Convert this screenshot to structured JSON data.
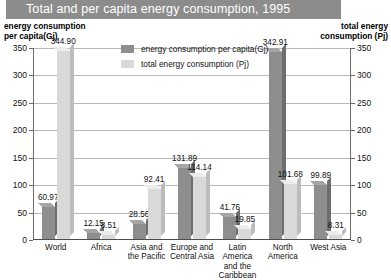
{
  "title": "Total and per capita energy consumption, 1995",
  "axis_captions": {
    "left": "energy consumption\nper capita(Gj)",
    "left_line1": "energy consumption",
    "left_line2": "per capita(Gj)",
    "right_line1": "total energy",
    "right_line2": "consumption (Pj)"
  },
  "colors": {
    "banner": "#8c8c8c",
    "series_per_capita": "#8e8e8e",
    "series_total": "#d9d9d9",
    "gridline": "#b9b9b9",
    "axis": "#6b6b6b"
  },
  "chart_data": {
    "type": "bar",
    "title": "Total and per capita energy consumption, 1995",
    "xlabel": "",
    "ylabel": "energy consumption per capita(Gj)",
    "y2label": "total energy consumption (Pj)",
    "ylim": [
      0,
      350
    ],
    "y2lim": [
      0,
      350
    ],
    "yticks": [
      0,
      50,
      100,
      150,
      200,
      250,
      300,
      350
    ],
    "y2ticks": [
      0,
      50,
      100,
      150,
      200,
      250,
      300,
      350
    ],
    "grid": true,
    "legend_position": "top-center",
    "categories": [
      "World",
      "Africa",
      "Asia and\nthe Pacific",
      "Europe and\nCentral Asia",
      "Latin America\nand the\nCaribbean",
      "North\nAmerica",
      "West Asia"
    ],
    "category_lines": [
      [
        "World"
      ],
      [
        "Africa"
      ],
      [
        "Asia and",
        "the Pacific"
      ],
      [
        "Europe and",
        "Central Asia"
      ],
      [
        "Latin America",
        "and the",
        "Caribbean"
      ],
      [
        "North",
        "America"
      ],
      [
        "West Asia"
      ]
    ],
    "series": [
      {
        "name": "energy consumption per capita(Gj)",
        "axis": "left",
        "color": "#8e8e8e",
        "values": [
          60.97,
          12.15,
          28.56,
          131.89,
          41.76,
          342.91,
          99.89
        ],
        "labels": [
          "60.97",
          "12.15",
          "28.56",
          "131.89",
          "41.76",
          "342.91",
          "99.89"
        ]
      },
      {
        "name": "total energy consumption (Pj)",
        "axis": "right",
        "color": "#d9d9d9",
        "values": [
          344.9,
          8.51,
          92.41,
          114.14,
          19.85,
          101.68,
          8.31
        ],
        "labels": [
          "344.90",
          "8.51",
          "92.41",
          "114.14",
          "19.85",
          "101.68",
          "8.31"
        ]
      }
    ]
  }
}
